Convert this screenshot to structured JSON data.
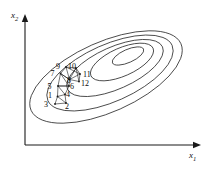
{
  "figure": {
    "title": "",
    "background": "#ffffff",
    "ink_color": "#1a1a1a",
    "width": 216,
    "height": 171
  },
  "axes": {
    "x": {
      "label_main": "x",
      "label_sub": "1",
      "name": "x1",
      "x1": 25,
      "y1": 145,
      "x2": 196,
      "y2": 145,
      "arrow": "right"
    },
    "y": {
      "label_main": "x",
      "label_sub": "2",
      "name": "x2",
      "x1": 25,
      "y1": 145,
      "x2": 25,
      "y2": 19,
      "arrow": "up"
    }
  },
  "contours": {
    "type": "nested-ellipses",
    "count": 5,
    "center": {
      "cx": 120,
      "cy": 73
    },
    "rotation_deg": -24,
    "levels": [
      {
        "level": 1,
        "rx": 17,
        "ry": 6.5,
        "cx": 128,
        "cy": 56
      },
      {
        "level": 2,
        "rx": 34,
        "ry": 14,
        "cx": 122,
        "cy": 62
      },
      {
        "level": 3,
        "rx": 52,
        "ry": 21,
        "cx": 115,
        "cy": 68
      },
      {
        "level": 4,
        "rx": 68,
        "ry": 28.5,
        "cx": 110,
        "cy": 73
      },
      {
        "level": 5,
        "rx": 82,
        "ry": 35,
        "cx": 106,
        "cy": 77
      }
    ]
  },
  "simplex": {
    "description": "numbered simplex search vertices",
    "vertices": [
      {
        "n": 1,
        "px": 57.5,
        "py": 96.5,
        "label": "1",
        "lx": 48,
        "ly": 92
      },
      {
        "n": 2,
        "px": 66,
        "py": 103,
        "label": "2",
        "lx": 65,
        "ly": 103
      },
      {
        "n": 3,
        "px": 55,
        "py": 104,
        "label": "3",
        "lx": 44,
        "ly": 101
      },
      {
        "n": 4,
        "px": 65,
        "py": 94.5,
        "label": "4",
        "lx": 66,
        "ly": 91
      },
      {
        "n": 5,
        "px": 58,
        "py": 86,
        "label": "5",
        "lx": 47.5,
        "ly": 83
      },
      {
        "n": 6,
        "px": 69,
        "py": 86,
        "label": "6",
        "lx": 70,
        "ly": 83
      },
      {
        "n": 7,
        "px": 60.5,
        "py": 73.5,
        "label": "7",
        "lx": 50.5,
        "ly": 70
      },
      {
        "n": 8,
        "px": 69.5,
        "py": 79.5,
        "label": "8",
        "lx": 67,
        "ly": 77
      },
      {
        "n": 9,
        "px": 66,
        "py": 67,
        "label": "9",
        "lx": 56,
        "ly": 62.5
      },
      {
        "n": 10,
        "px": 76,
        "py": 68,
        "label": "10",
        "lx": 68,
        "ly": 62.5
      },
      {
        "n": 11,
        "px": 80,
        "py": 74,
        "label": "11",
        "lx": 83,
        "ly": 70.5
      },
      {
        "n": 12,
        "px": 79,
        "py": 81.5,
        "label": "12",
        "lx": 81,
        "ly": 79.5
      }
    ],
    "edges": [
      [
        1,
        2
      ],
      [
        2,
        3
      ],
      [
        3,
        1
      ],
      [
        1,
        4
      ],
      [
        4,
        2
      ],
      [
        1,
        5
      ],
      [
        5,
        4
      ],
      [
        4,
        6
      ],
      [
        6,
        5
      ],
      [
        5,
        7
      ],
      [
        7,
        6
      ],
      [
        6,
        8
      ],
      [
        8,
        7
      ],
      [
        7,
        9
      ],
      [
        9,
        8
      ],
      [
        8,
        10
      ],
      [
        10,
        9
      ],
      [
        9,
        11
      ],
      [
        11,
        10
      ],
      [
        10,
        12
      ],
      [
        12,
        11
      ],
      [
        8,
        11
      ],
      [
        8,
        12
      ],
      [
        7,
        8
      ],
      [
        5,
        6
      ]
    ]
  }
}
